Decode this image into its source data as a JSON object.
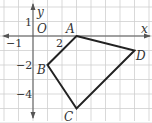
{
  "diagram": {
    "type": "coordinate-grid-quadrilateral",
    "grid": {
      "unit_px": 14.5,
      "origin_px": [
        33,
        36
      ],
      "x_range": [
        -2,
        8
      ],
      "y_range": [
        2,
        -6
      ],
      "grid_color": "#c8c8c8",
      "axis_color": "#555555"
    },
    "axes": {
      "x_label": "x",
      "y_label": "y",
      "origin_label": "O",
      "ticks": [
        {
          "label": "−1",
          "axis": "x",
          "value": -1
        },
        {
          "label": "2",
          "axis": "x",
          "value": 2
        },
        {
          "label": "1",
          "axis": "y",
          "value": 1
        },
        {
          "label": "−2",
          "axis": "y",
          "value": -2
        },
        {
          "label": "−4",
          "axis": "y",
          "value": -4
        }
      ]
    },
    "polygon": {
      "stroke_color": "#222222",
      "vertices": [
        {
          "name": "A",
          "x": 3,
          "y": 0
        },
        {
          "name": "D",
          "x": 7,
          "y": -1
        },
        {
          "name": "C",
          "x": 3,
          "y": -5
        },
        {
          "name": "B",
          "x": 1,
          "y": -2
        }
      ]
    }
  }
}
